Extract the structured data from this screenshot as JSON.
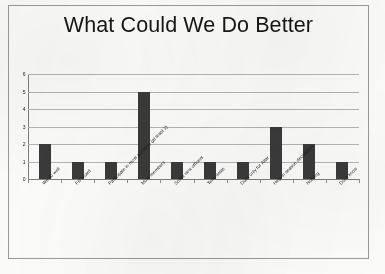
{
  "slide": {
    "title": "What Could We Do Better"
  },
  "chart_data": {
    "type": "bar",
    "title": "What Could We Do Better",
    "xlabel": "",
    "ylabel": "",
    "ylim": [
      0,
      6
    ],
    "ytick_labels": [
      "0",
      "1",
      "2",
      "3",
      "4",
      "5",
      "6"
    ],
    "ytick_values": [
      0,
      1,
      2,
      3,
      4,
      5,
      6
    ],
    "grid": true,
    "legend": false,
    "bar_color": "#3a3a3a",
    "gridline_color": "#b4b4b4",
    "axis_color": "#7d7d7d",
    "categories": [
      "We do well",
      "Fill Board",
      "Participate in most activities (at least 1)",
      "More members",
      "Solicit new officers",
      "Term limits",
      "Dues only for Altar",
      "Help in season decoration",
      "Nothing",
      "Don't know"
    ],
    "values": [
      2,
      1,
      1,
      5,
      1,
      1,
      1,
      3,
      2,
      1
    ]
  }
}
